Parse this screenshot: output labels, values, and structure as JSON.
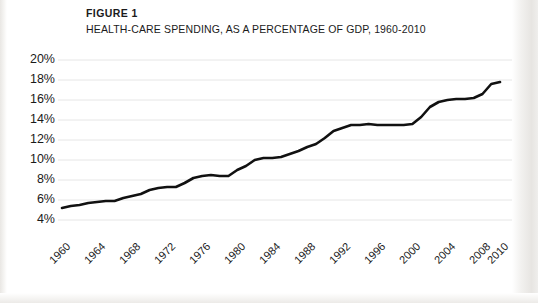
{
  "figure": {
    "label": "FIGURE 1",
    "title": "HEALTH-CARE SPENDING, AS A PERCENTAGE OF GDP, 1960-2010"
  },
  "colors": {
    "line": "#111111",
    "grid": "#e6e6e6",
    "text": "#1a1a1a",
    "page": "#ffffff"
  },
  "chart_data": {
    "type": "line",
    "title": "HEALTH-CARE SPENDING, AS A PERCENTAGE OF GDP, 1960-2010",
    "xlabel": "",
    "ylabel": "",
    "xlim": [
      1960,
      2010
    ],
    "ylim": [
      4,
      20
    ],
    "ytick_labels": [
      "20%",
      "18%",
      "16%",
      "14%",
      "12%",
      "10%",
      "8%",
      "6%",
      "4%"
    ],
    "ytick_values": [
      20,
      18,
      16,
      14,
      12,
      10,
      8,
      6,
      4
    ],
    "xtick_labels": [
      "1960",
      "1964",
      "1968",
      "1972",
      "1976",
      "1980",
      "1984",
      "1988",
      "1992",
      "1996",
      "2000",
      "2004",
      "2008",
      "2010"
    ],
    "xtick_values": [
      1960,
      1964,
      1968,
      1972,
      1976,
      1980,
      1984,
      1988,
      1992,
      1996,
      2000,
      2004,
      2008,
      2010
    ],
    "grid": true,
    "grid_axis": "y",
    "legend": false,
    "series": [
      {
        "name": "Health-care spending (% of GDP)",
        "x": [
          1960,
          1961,
          1962,
          1963,
          1964,
          1965,
          1966,
          1967,
          1968,
          1969,
          1970,
          1971,
          1972,
          1973,
          1974,
          1975,
          1976,
          1977,
          1978,
          1979,
          1980,
          1981,
          1982,
          1983,
          1984,
          1985,
          1986,
          1987,
          1988,
          1989,
          1990,
          1991,
          1992,
          1993,
          1994,
          1995,
          1996,
          1997,
          1998,
          1999,
          2000,
          2001,
          2002,
          2003,
          2004,
          2005,
          2006,
          2007,
          2008,
          2009,
          2010
        ],
        "values": [
          5.2,
          5.4,
          5.5,
          5.7,
          5.8,
          5.9,
          5.9,
          6.2,
          6.4,
          6.6,
          7.0,
          7.2,
          7.3,
          7.3,
          7.7,
          8.2,
          8.4,
          8.5,
          8.4,
          8.4,
          9.0,
          9.4,
          10.0,
          10.2,
          10.2,
          10.3,
          10.6,
          10.9,
          11.3,
          11.6,
          12.2,
          12.9,
          13.2,
          13.5,
          13.5,
          13.6,
          13.5,
          13.5,
          13.5,
          13.5,
          13.6,
          14.3,
          15.3,
          15.8,
          16.0,
          16.1,
          16.1,
          16.2,
          16.6,
          17.6,
          17.8
        ]
      }
    ]
  }
}
